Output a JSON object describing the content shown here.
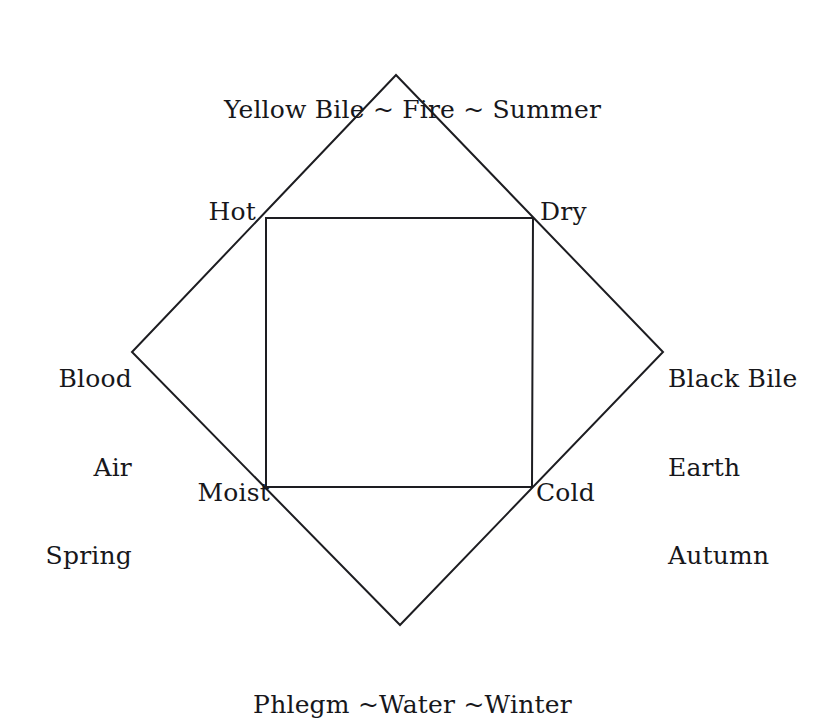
{
  "diagram": {
    "stroke_color": "#1d1d21",
    "background_color": "#ffffff",
    "outer_shape": {
      "name": "diamond",
      "vertices": {
        "top": {
          "x": 396,
          "y": 75
        },
        "right": {
          "x": 663,
          "y": 352
        },
        "bottom": {
          "x": 400,
          "y": 625
        },
        "left": {
          "x": 132,
          "y": 352
        }
      }
    },
    "inner_shape": {
      "name": "square",
      "corners": {
        "top_left": {
          "x": 266,
          "y": 218
        },
        "top_right": {
          "x": 533,
          "y": 218
        },
        "bottom_right": {
          "x": 532,
          "y": 487
        },
        "bottom_left": {
          "x": 266,
          "y": 487
        }
      }
    },
    "vertex_labels": {
      "top": {
        "text": "Yellow Bile ~ Fire ~ Summer",
        "lines": [
          "Yellow Bile ~ Fire ~ Summer"
        ]
      },
      "bottom": {
        "text": "Phlegm ~Water ~Winter",
        "lines": [
          "Phlegm ~Water ~Winter"
        ]
      },
      "left": {
        "text": "Blood Air Spring",
        "lines": [
          "Blood",
          "Air",
          "Spring"
        ]
      },
      "right": {
        "text": "Black Bile Earth Autumn",
        "lines": [
          "Black Bile",
          "Earth",
          "Autumn"
        ]
      }
    },
    "quality_labels": {
      "hot": "Hot",
      "dry": "Dry",
      "moist": "Moist",
      "cold": "Cold"
    }
  }
}
